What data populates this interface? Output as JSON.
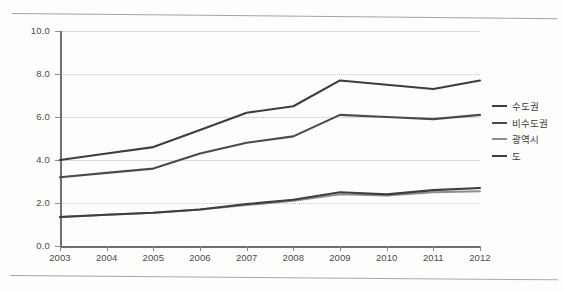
{
  "chart_data": {
    "type": "line",
    "title": "",
    "subtitle": "",
    "xlabel": "",
    "ylabel": "",
    "categories": [
      "2003",
      "2004",
      "2005",
      "2006",
      "2007",
      "2008",
      "2009",
      "2010",
      "2011",
      "2012"
    ],
    "x": [
      2003,
      2004,
      2005,
      2006,
      2007,
      2008,
      2009,
      2010,
      2011,
      2012
    ],
    "xlim": [
      2003,
      2012
    ],
    "ylim": [
      0.0,
      10.0
    ],
    "yticks": [
      "0.0",
      "2.0",
      "4.0",
      "6.0",
      "8.0",
      "10.0"
    ],
    "ytick_values": [
      0.0,
      2.0,
      4.0,
      6.0,
      8.0,
      10.0
    ],
    "grid": true,
    "legend_position": "right",
    "series": [
      {
        "name": "수도권",
        "color": "#3d3d3d",
        "values": [
          4.0,
          4.3,
          4.6,
          5.4,
          6.2,
          6.5,
          7.7,
          7.5,
          7.3,
          7.7
        ]
      },
      {
        "name": "비수도권",
        "color": "#4a4a4a",
        "values": [
          3.2,
          3.4,
          3.6,
          4.3,
          4.8,
          5.1,
          6.1,
          6.0,
          5.9,
          6.1
        ]
      },
      {
        "name": "광역시",
        "color": "#8d8d8d",
        "values": [
          1.35,
          1.45,
          1.55,
          1.7,
          1.9,
          2.1,
          2.4,
          2.35,
          2.5,
          2.55
        ]
      },
      {
        "name": "도",
        "color": "#3d3d3d",
        "values": [
          1.35,
          1.45,
          1.55,
          1.7,
          1.95,
          2.15,
          2.5,
          2.4,
          2.6,
          2.7
        ]
      }
    ]
  },
  "legend": {
    "items": [
      {
        "label": "수도권",
        "color": "#3d3d3d"
      },
      {
        "label": "비수도권",
        "color": "#4a4a4a"
      },
      {
        "label": "광역시",
        "color": "#8d8d8d"
      },
      {
        "label": "도",
        "color": "#3d3d3d"
      }
    ]
  },
  "axes": {
    "y_labels": [
      "10.0",
      "8.0",
      "6.0",
      "4.0",
      "2.0",
      "0.0"
    ],
    "x_labels": [
      "2003",
      "2004",
      "2005",
      "2006",
      "2007",
      "2008",
      "2009",
      "2010",
      "2011",
      "2012"
    ]
  }
}
